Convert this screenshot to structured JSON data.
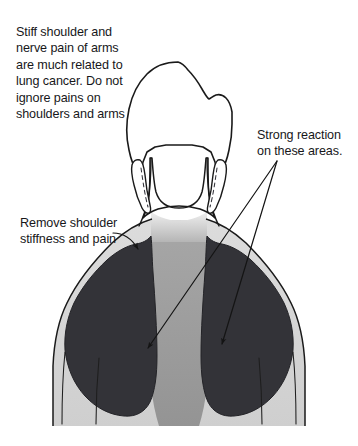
{
  "illustration": {
    "title": "Rear view of head, neck and shoulders with acupressure regions",
    "view": "posterior",
    "background_color": "#ffffff",
    "outline_color": "#1a1a1a",
    "regions": {
      "dark_trapezius": {
        "label": "shaded trapezius and shoulder region",
        "color": "#333338"
      },
      "mid_gray_spine": {
        "label": "central spine and upper back band",
        "color": "#9a9a9a"
      },
      "light_gray_arms": {
        "label": "outer shoulder and upper arm band",
        "color": "#d6d6d6"
      },
      "neck_shadow": {
        "label": "base of neck shading",
        "color": "#c9c9c9"
      }
    }
  },
  "annotations": {
    "stiff_shoulder": {
      "text": "Stiff shoulder and\nnerve pain of arms\nare much related to\nlung cancer. Do not\nignore pains on\nshoulders and arms",
      "position": "top-left",
      "has_leader_line": false
    },
    "strong_reaction": {
      "text": "Strong reaction\non these areas.",
      "position": "right",
      "has_leader_line": true,
      "leader_lines": 2
    },
    "remove_stiffness": {
      "text": "Remove shoulder\nstiffness and pain",
      "position": "middle-left",
      "has_leader_line": true,
      "leader_lines": 1
    }
  }
}
